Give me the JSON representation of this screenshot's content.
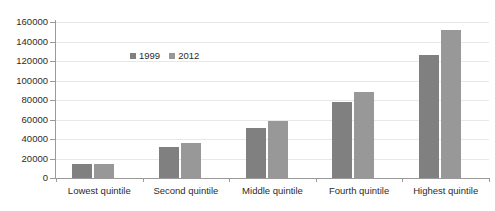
{
  "chart_data": {
    "type": "bar",
    "title": "",
    "subtitle": "",
    "xlabel": "",
    "ylabel": "",
    "categories": [
      "Lowest quintile",
      "Second quintile",
      "Middle quintile",
      "Fourth quintile",
      "Highest quintile"
    ],
    "series": [
      {
        "name": "1999",
        "color": "#808080",
        "values": [
          14000,
          32000,
          51000,
          78000,
          126000
        ]
      },
      {
        "name": "2012",
        "color": "#989898",
        "values": [
          14500,
          36000,
          58000,
          88000,
          152000
        ]
      }
    ],
    "ylim": [
      0,
      160000
    ],
    "ytick_step": 20000,
    "yticks": [
      0,
      20000,
      40000,
      60000,
      80000,
      100000,
      120000,
      140000,
      160000
    ],
    "ytick_labels": [
      "0",
      "20000",
      "40000",
      "60000",
      "80000",
      "100000",
      "120000",
      "140000",
      "160000"
    ],
    "grid": true,
    "grid_axis": "y",
    "legend": [
      "1999",
      "2012"
    ],
    "legend_position": "inside-upper-left",
    "axis_color": "#9a9a9a",
    "gridline_color": "#e8e8e8",
    "background": "#ffffff",
    "text_color": "#2b2b2b"
  }
}
